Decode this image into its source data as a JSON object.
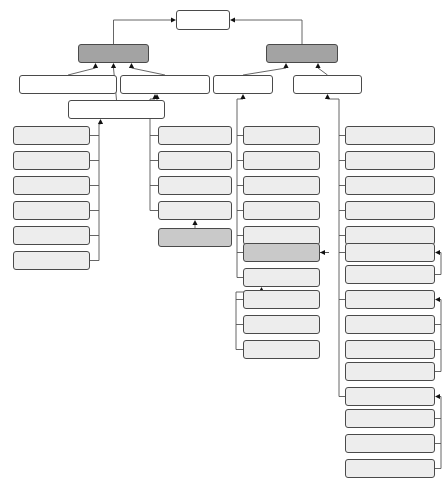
{
  "diagram": {
    "type": "uml-class-hierarchy",
    "canvas": {
      "width": 445,
      "height": 483
    },
    "colors": {
      "root_fill": "#ffffff",
      "dark_fill": "#a3a3a3",
      "light_fill": "#ededed",
      "mid_fill": "#c9c9c9",
      "border": "#4a4a4a",
      "edge": "#555555",
      "background": "#ffffff"
    },
    "nodes": [
      {
        "id": "violation",
        "label": "Violation",
        "x": 176,
        "y": 10,
        "w": 54,
        "h": 20,
        "tier": "root",
        "font": 7.2
      },
      {
        "id": "instance_violation",
        "label": "InstanceViolation",
        "x": 78,
        "y": 44,
        "w": 71,
        "h": 19,
        "tier": "dark",
        "font": 7.2
      },
      {
        "id": "schema_violation",
        "label": "SchemaViolation",
        "x": 266,
        "y": 44,
        "w": 72,
        "h": 19,
        "tier": "dark",
        "font": 7.2
      },
      {
        "id": "instance_blank_node_violation",
        "label": "InstanceBlankNodeViolation",
        "x": 19,
        "y": 75,
        "w": 98,
        "h": 19,
        "tier": "plain",
        "font": 6.6
      },
      {
        "id": "not_an_element_violation",
        "label": "NotAnElementViolation",
        "x": 120,
        "y": 75,
        "w": 90,
        "h": 19,
        "tier": "plain",
        "font": 6.9
      },
      {
        "id": "class_violaion",
        "label": "ClassViolaion",
        "x": 213,
        "y": 75,
        "w": 60,
        "h": 19,
        "tier": "plain",
        "font": 6.9
      },
      {
        "id": "property_violation",
        "label": "PropertyViolation",
        "x": 293,
        "y": 75,
        "w": 69,
        "h": 19,
        "tier": "plain",
        "font": 6.9
      },
      {
        "id": "instance_property_violation",
        "label": "InstancePropertyViolation",
        "x": 68,
        "y": 100,
        "w": 97,
        "h": 19,
        "tier": "plain",
        "font": 6.8
      },
      {
        "id": "no_property_domain",
        "label": "NoPropertyDomain",
        "x": 13,
        "y": 126,
        "w": 77,
        "h": 19,
        "tier": "light",
        "font": 6.8
      },
      {
        "id": "no_property_range",
        "label": "NoPropertyRange",
        "x": 13,
        "y": 151,
        "w": 77,
        "h": 19,
        "tier": "light",
        "font": 6.8
      },
      {
        "id": "invalid_edge",
        "label": "InvalidEdge",
        "x": 13,
        "y": 176,
        "w": 77,
        "h": 19,
        "tier": "light",
        "font": 6.8
      },
      {
        "id": "not_functional_property",
        "label": "NotFunctionalProperty",
        "x": 13,
        "y": 201,
        "w": 77,
        "h": 19,
        "tier": "light",
        "font": 6.6
      },
      {
        "id": "local_orphan_property",
        "label": "LocalOrphanProperty",
        "x": 13,
        "y": 226,
        "w": 77,
        "h": 19,
        "tier": "light",
        "font": 6.6
      },
      {
        "id": "not_inverse_functional_property",
        "label": "NotInverseFunctionalProperty",
        "x": 13,
        "y": 251,
        "w": 77,
        "h": 19,
        "tier": "light",
        "font": 6.1
      },
      {
        "id": "not_restriction_element",
        "label": "NotRestrictionElement",
        "x": 158,
        "y": 126,
        "w": 74,
        "h": 19,
        "tier": "light",
        "font": 6.5
      },
      {
        "id": "object_invalid_at_class",
        "label": "ObjectInvalidAtClass",
        "x": 158,
        "y": 151,
        "w": 74,
        "h": 19,
        "tier": "light",
        "font": 6.5
      },
      {
        "id": "edge_orphan_instance",
        "label": "EdgeOrphanInstance",
        "x": 158,
        "y": 176,
        "w": 74,
        "h": 19,
        "tier": "light",
        "font": 6.5
      },
      {
        "id": "data_invalid_at_datatype",
        "label": "DataInvalidAtDatatype",
        "x": 158,
        "y": 201,
        "w": 74,
        "h": 19,
        "tier": "light",
        "font": 6.3
      },
      {
        "id": "not_base_type_element",
        "label": "NotBaseTypeElement",
        "x": 158,
        "y": 228,
        "w": 74,
        "h": 19,
        "tier": "mid",
        "font": 6.5
      },
      {
        "id": "not_unique_class_label",
        "label": "NotUniqueClassLabel",
        "x": 243,
        "y": 126,
        "w": 77,
        "h": 19,
        "tier": "light",
        "font": 6.5
      },
      {
        "id": "not_unique_class_name",
        "label": "NotUniqueClassName",
        "x": 243,
        "y": 151,
        "w": 77,
        "h": 19,
        "tier": "light",
        "font": 6.5
      },
      {
        "id": "not_domain_class",
        "label": "NotDomainClass",
        "x": 243,
        "y": 176,
        "w": 77,
        "h": 19,
        "tier": "light",
        "font": 6.7
      },
      {
        "id": "class_cycle",
        "label": "ClassCycle",
        "x": 243,
        "y": 201,
        "w": 77,
        "h": 19,
        "tier": "light",
        "font": 6.7
      },
      {
        "id": "no_immediate_class",
        "label": "NoImmediateClass",
        "x": 243,
        "y": 226,
        "w": 77,
        "h": 19,
        "tier": "light",
        "font": 6.7
      },
      {
        "id": "not_super_class_of_class",
        "label": "NotSuperClassOfClass",
        "x": 243,
        "y": 243,
        "w": 77,
        "h": 19,
        "tier": "mid",
        "font": 6.5
      },
      {
        "id": "orphan_class",
        "label": "OrphanClass",
        "x": 243,
        "y": 268,
        "w": 77,
        "h": 19,
        "tier": "light",
        "font": 6.7
      },
      {
        "id": "not_intersection_of_class",
        "label": "NotIntersectionOfClass",
        "x": 243,
        "y": 290,
        "w": 77,
        "h": 19,
        "tier": "light",
        "font": 6.4
      },
      {
        "id": "not_subclass_of_class",
        "label": "NotSubclassOfClass",
        "x": 243,
        "y": 315,
        "w": 77,
        "h": 19,
        "tier": "light",
        "font": 6.6
      },
      {
        "id": "not_union_of_class",
        "label": "NotUnionOfClass",
        "x": 243,
        "y": 340,
        "w": 77,
        "h": 19,
        "tier": "light",
        "font": 6.6
      },
      {
        "id": "property_cycle",
        "label": "PropertyCycle",
        "x": 345,
        "y": 126,
        "w": 90,
        "h": 19,
        "tier": "light",
        "font": 6.8
      },
      {
        "id": "not_unique_property_name",
        "label": "NotUniquePropertyName",
        "x": 345,
        "y": 151,
        "w": 90,
        "h": 19,
        "tier": "light",
        "font": 6.6
      },
      {
        "id": "schema_blank_node",
        "label": "SchemaBlankNode",
        "x": 345,
        "y": 176,
        "w": 90,
        "h": 19,
        "tier": "light",
        "font": 6.8
      },
      {
        "id": "property_type_overload",
        "label": "PropertyTypeOverload",
        "x": 345,
        "y": 201,
        "w": 90,
        "h": 19,
        "tier": "light",
        "font": 6.7
      },
      {
        "id": "property_annotation_overload",
        "label": "PropertyAnnotationOverload",
        "x": 345,
        "y": 226,
        "w": 90,
        "h": 19,
        "tier": "light",
        "font": 6.2
      },
      {
        "id": "orphan_property",
        "label": "OrphanProperty",
        "x": 345,
        "y": 243,
        "w": 90,
        "h": 19,
        "tier": "light",
        "font": 6.8
      },
      {
        "id": "not_subproperty_of_property",
        "label": "NotSubpropertyOfProperty",
        "x": 345,
        "y": 265,
        "w": 90,
        "h": 19,
        "tier": "light",
        "font": 6.4
      },
      {
        "id": "property_domain",
        "label": "PropertyDomain",
        "x": 345,
        "y": 290,
        "w": 90,
        "h": 19,
        "tier": "light",
        "font": 6.8
      },
      {
        "id": "invalid_domain",
        "label": "InvalidDomain",
        "x": 345,
        "y": 315,
        "w": 90,
        "h": 19,
        "tier": "light",
        "font": 6.8
      },
      {
        "id": "domain_not_subsumed",
        "label": "DomainNotSubsumed",
        "x": 345,
        "y": 340,
        "w": 90,
        "h": 19,
        "tier": "light",
        "font": 6.7
      },
      {
        "id": "no_explicit_domain",
        "label": "NoExplicitDomain",
        "x": 345,
        "y": 362,
        "w": 90,
        "h": 19,
        "tier": "light",
        "font": 6.8
      },
      {
        "id": "property_range",
        "label": "PropertyRange",
        "x": 345,
        "y": 387,
        "w": 90,
        "h": 19,
        "tier": "light",
        "font": 6.8
      },
      {
        "id": "invalid_range",
        "label": "InvalidRange",
        "x": 345,
        "y": 409,
        "w": 90,
        "h": 19,
        "tier": "light",
        "font": 6.8
      },
      {
        "id": "range_not_subsumed",
        "label": "RangeNotSubsumed",
        "x": 345,
        "y": 434,
        "w": 90,
        "h": 19,
        "tier": "light",
        "font": 6.8
      },
      {
        "id": "not_explicit_range",
        "label": "NotExplicitRange",
        "x": 345,
        "y": 459,
        "w": 90,
        "h": 19,
        "tier": "light",
        "font": 6.8
      }
    ],
    "edges": [
      {
        "from": "instance_violation",
        "to": "violation"
      },
      {
        "from": "schema_violation",
        "to": "violation"
      },
      {
        "from": "instance_blank_node_violation",
        "to": "instance_violation"
      },
      {
        "from": "instance_property_violation",
        "to": "instance_violation"
      },
      {
        "from": "not_an_element_violation",
        "to": "instance_violation"
      },
      {
        "from": "class_violaion",
        "to": "schema_violation"
      },
      {
        "from": "property_violation",
        "to": "schema_violation"
      },
      {
        "from": "no_property_domain",
        "to": "instance_property_violation"
      },
      {
        "from": "no_property_range",
        "to": "instance_property_violation"
      },
      {
        "from": "invalid_edge",
        "to": "instance_property_violation"
      },
      {
        "from": "not_functional_property",
        "to": "instance_property_violation"
      },
      {
        "from": "local_orphan_property",
        "to": "instance_property_violation"
      },
      {
        "from": "not_inverse_functional_property",
        "to": "instance_property_violation"
      },
      {
        "from": "not_restriction_element",
        "to": "not_an_element_violation"
      },
      {
        "from": "object_invalid_at_class",
        "to": "not_an_element_violation"
      },
      {
        "from": "edge_orphan_instance",
        "to": "not_an_element_violation"
      },
      {
        "from": "data_invalid_at_datatype",
        "to": "not_an_element_violation"
      },
      {
        "from": "not_base_type_element",
        "to": "data_invalid_at_datatype"
      },
      {
        "from": "not_unique_class_label",
        "to": "class_violaion"
      },
      {
        "from": "not_unique_class_name",
        "to": "class_violaion"
      },
      {
        "from": "not_domain_class",
        "to": "class_violaion"
      },
      {
        "from": "class_cycle",
        "to": "class_violaion"
      },
      {
        "from": "no_immediate_class",
        "to": "class_violaion"
      },
      {
        "from": "not_super_class_of_class",
        "to": "class_violaion"
      },
      {
        "from": "orphan_class",
        "to": "class_violaion"
      },
      {
        "from": "not_intersection_of_class",
        "to": "orphan_class"
      },
      {
        "from": "not_subclass_of_class",
        "to": "orphan_class"
      },
      {
        "from": "not_union_of_class",
        "to": "orphan_class"
      },
      {
        "from": "property_cycle",
        "to": "property_violation"
      },
      {
        "from": "not_unique_property_name",
        "to": "property_violation"
      },
      {
        "from": "schema_blank_node",
        "to": "property_violation"
      },
      {
        "from": "property_type_overload",
        "to": "property_violation"
      },
      {
        "from": "property_annotation_overload",
        "to": "property_violation"
      },
      {
        "from": "orphan_property",
        "to": "property_violation"
      },
      {
        "from": "property_domain",
        "to": "property_violation"
      },
      {
        "from": "property_range",
        "to": "property_violation"
      },
      {
        "from": "not_subproperty_of_property",
        "to": "orphan_property"
      },
      {
        "from": "invalid_domain",
        "to": "property_domain"
      },
      {
        "from": "domain_not_subsumed",
        "to": "property_domain"
      },
      {
        "from": "no_explicit_domain",
        "to": "property_domain"
      },
      {
        "from": "invalid_range",
        "to": "property_range"
      },
      {
        "from": "range_not_subsumed",
        "to": "property_range"
      },
      {
        "from": "not_explicit_range",
        "to": "property_range"
      }
    ]
  }
}
